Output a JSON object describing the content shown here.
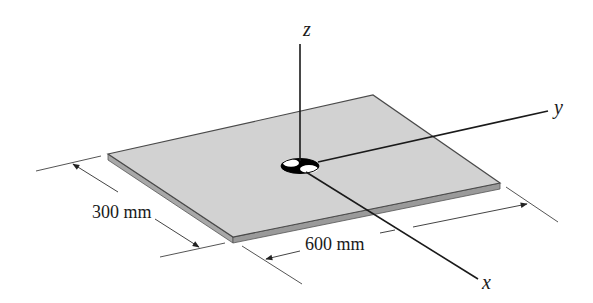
{
  "figure": {
    "colors": {
      "plate_top": "#d2d2d2",
      "plate_edge": "#9a9a9a",
      "plate_outline": "#4a4a4a",
      "axis": "#1a1a1a",
      "dimension_line": "#555555",
      "hole_dark": "#000000",
      "hole_light": "#ffffff"
    }
  },
  "axes": {
    "z": {
      "label": "z"
    },
    "y": {
      "label": "y"
    },
    "x": {
      "label": "x"
    }
  },
  "dimensions": {
    "width": {
      "label": "300 mm"
    },
    "length": {
      "label": "600 mm"
    }
  }
}
